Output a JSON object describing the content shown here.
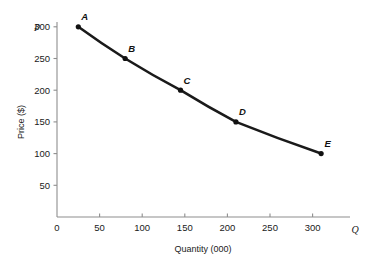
{
  "chart_data": {
    "type": "line",
    "title": "",
    "xlabel": "Quantity (000)",
    "ylabel": "Price ($)",
    "x_axis_symbol": "Q",
    "y_axis_symbol": "P",
    "xlim": [
      0,
      325
    ],
    "ylim": [
      0,
      315
    ],
    "grid": false,
    "legend": "none",
    "xticks": [
      0,
      50,
      100,
      150,
      200,
      250,
      300
    ],
    "xtick_labels": [
      "0",
      "50",
      "100",
      "150",
      "200",
      "250",
      "300"
    ],
    "yticks": [
      50,
      100,
      150,
      200,
      250,
      300
    ],
    "ytick_labels": [
      "50",
      "100",
      "150",
      "200",
      "250",
      "300"
    ],
    "series": [
      {
        "name": "Demand",
        "point_labels": [
          "A",
          "B",
          "C",
          "D",
          "E"
        ],
        "x": [
          25,
          80,
          145,
          210,
          310
        ],
        "y": [
          300,
          250,
          200,
          150,
          100
        ]
      }
    ],
    "annotations": [
      {
        "label": "A",
        "x": 25,
        "y": 300
      },
      {
        "label": "B",
        "x": 80,
        "y": 250
      },
      {
        "label": "C",
        "x": 145,
        "y": 200
      },
      {
        "label": "D",
        "x": 210,
        "y": 150
      },
      {
        "label": "E",
        "x": 310,
        "y": 100
      }
    ],
    "colors": {
      "curve": "#1a1a1a",
      "point": "#111111",
      "axis": "#8e8e8e",
      "text": "#1a1a1a",
      "background": "#ffffff"
    }
  }
}
